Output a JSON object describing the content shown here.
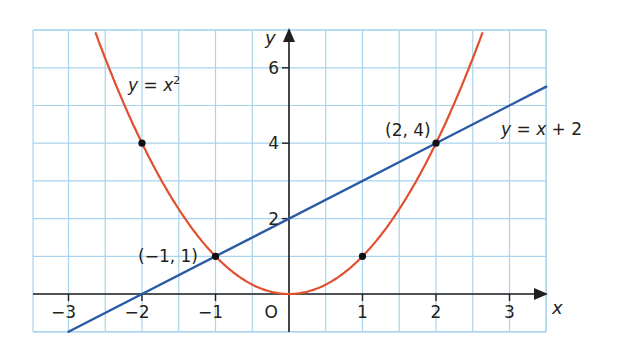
{
  "chart_data": {
    "type": "line",
    "title": "",
    "xlabel": "x",
    "ylabel": "y",
    "origin_label": "O",
    "xlim": [
      -3.5,
      3.5
    ],
    "ylim": [
      -1,
      7
    ],
    "grid": true,
    "x_ticks": [
      -3,
      -2,
      -1,
      1,
      2,
      3
    ],
    "x_tick_labels": [
      "−3",
      "−2",
      "−1",
      "1",
      "2",
      "3"
    ],
    "y_ticks": [
      2,
      4,
      6
    ],
    "y_tick_labels": [
      "2",
      "4",
      "6"
    ],
    "series": [
      {
        "name": "y = x²",
        "label": "y = x",
        "label_sup": "2",
        "expression": "x^2",
        "color": "#e0502e",
        "x": [
          -2.65,
          -2,
          -1.5,
          -1,
          -0.5,
          0,
          0.5,
          1,
          1.5,
          2,
          2.65
        ],
        "y": [
          7.0,
          4,
          2.25,
          1,
          0.25,
          0,
          0.25,
          1,
          2.25,
          4,
          7.0
        ]
      },
      {
        "name": "y = x + 2",
        "label": "y = x + 2",
        "expression": "x+2",
        "color": "#2a5aa5",
        "x": [
          -3,
          3.5
        ],
        "y": [
          -1,
          5.5
        ]
      }
    ],
    "points": [
      {
        "x": -2,
        "y": 4,
        "label": ""
      },
      {
        "x": -1,
        "y": 1,
        "label": "(−1, 1)"
      },
      {
        "x": 1,
        "y": 1,
        "label": ""
      },
      {
        "x": 2,
        "y": 4,
        "label": "(2, 4)"
      }
    ]
  },
  "colors": {
    "grid": "#a8d4ee",
    "axis": "#231f20",
    "parabola": "#e0502e",
    "line": "#2a5aa5",
    "point": "#111111"
  }
}
